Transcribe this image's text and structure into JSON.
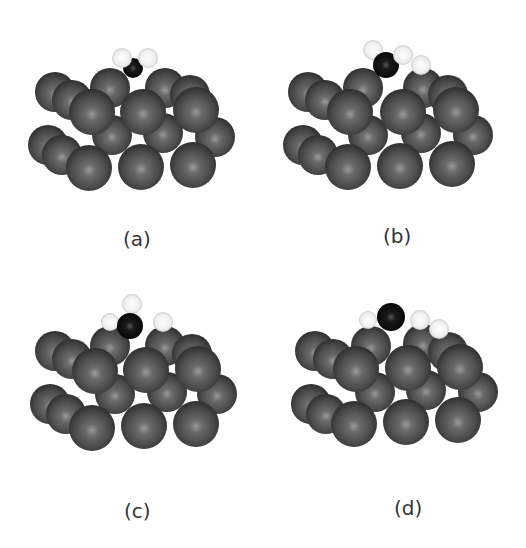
{
  "figure": {
    "panels": [
      {
        "id": "a",
        "label": "(a)",
        "adsorbate_atoms": {
          "carbon": 1,
          "hydrogen": 2
        }
      },
      {
        "id": "b",
        "label": "(b)",
        "adsorbate_atoms": {
          "carbon": 1,
          "hydrogen": 3
        }
      },
      {
        "id": "c",
        "label": "(c)",
        "adsorbate_atoms": {
          "carbon": 1,
          "hydrogen": 3
        }
      },
      {
        "id": "d",
        "label": "(d)",
        "adsorbate_atoms": {
          "carbon": 1,
          "hydrogen": 3
        }
      }
    ],
    "colors": {
      "substrate_atom": "#555555",
      "carbon_atom": "#111111",
      "hydrogen_atom": "#f2f2f2",
      "background": "#ffffff",
      "label_text": "#333333"
    }
  }
}
